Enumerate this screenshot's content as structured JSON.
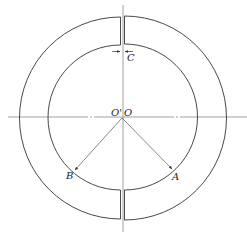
{
  "diagram": {
    "type": "split-ring-cross-section",
    "colors": {
      "stroke": "#333333",
      "axis": "#888888",
      "background": "#ffffff"
    },
    "labels": {
      "gap": "C",
      "center_left": "O'",
      "center_right": "O",
      "point_a": "A",
      "point_b": "B"
    },
    "geometry": {
      "center": [
        122,
        117
      ],
      "outer_radius": 100,
      "inner_radius": 72,
      "gap_width": 3
    }
  }
}
